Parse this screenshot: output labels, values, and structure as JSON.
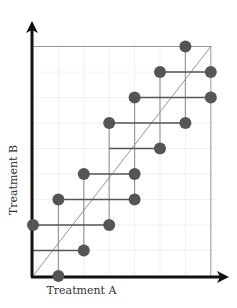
{
  "chart_data": {
    "type": "scatter",
    "title": "",
    "xlabel": "Treatment A",
    "ylabel": "Treatment B",
    "xlim": [
      0,
      7
    ],
    "ylim": [
      0,
      9
    ],
    "grid": true,
    "legend": null,
    "points": [
      {
        "x": 6,
        "y": 9
      },
      {
        "x": 5,
        "y": 8
      },
      {
        "x": 7,
        "y": 8
      },
      {
        "x": 4,
        "y": 7
      },
      {
        "x": 7,
        "y": 7
      },
      {
        "x": 3,
        "y": 6
      },
      {
        "x": 6,
        "y": 6
      },
      {
        "x": 5,
        "y": 5
      },
      {
        "x": 2,
        "y": 4
      },
      {
        "x": 4,
        "y": 4
      },
      {
        "x": 1,
        "y": 3
      },
      {
        "x": 4,
        "y": 3
      },
      {
        "x": 0,
        "y": 2
      },
      {
        "x": 3,
        "y": 2
      },
      {
        "x": 2,
        "y": 1
      },
      {
        "x": 1,
        "y": 0
      }
    ],
    "horizontal_segments": [
      {
        "y": 8,
        "x1": 5,
        "x2": 7
      },
      {
        "y": 7,
        "x1": 4,
        "x2": 7
      },
      {
        "y": 6,
        "x1": 3,
        "x2": 6
      },
      {
        "y": 5,
        "x1": 3,
        "x2": 5
      },
      {
        "y": 4,
        "x1": 2,
        "x2": 4
      },
      {
        "y": 3,
        "x1": 1,
        "x2": 4
      },
      {
        "y": 2,
        "x1": 0,
        "x2": 3
      },
      {
        "y": 1,
        "x1": 0,
        "x2": 2
      }
    ],
    "vertical_segments": [
      {
        "x": 6,
        "y1": 6,
        "y2": 9
      },
      {
        "x": 5,
        "y1": 5,
        "y2": 8
      },
      {
        "x": 4,
        "y1": 3,
        "y2": 7
      },
      {
        "x": 3,
        "y1": 2,
        "y2": 6
      },
      {
        "x": 2,
        "y1": 1,
        "y2": 4
      },
      {
        "x": 1,
        "y1": 0,
        "y2": 3
      }
    ],
    "reference_line": {
      "from": [
        0,
        0
      ],
      "to": [
        7,
        9
      ],
      "label": "diagonal"
    },
    "frame": {
      "top_y": 9,
      "right_x": 7
    }
  },
  "colors": {
    "axis": "#111111",
    "point": "#555555",
    "horizontal_line": "#555555",
    "vertical_line": "#999999",
    "frame": "#999999",
    "diagonal": "#777777",
    "grid": "#f0f0f0"
  }
}
